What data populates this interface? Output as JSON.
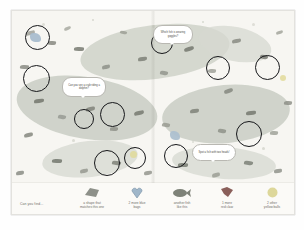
{
  "page": {
    "type": "seek-and-find picture book spread",
    "theme": "underwater ocean scene"
  },
  "scene": {
    "bubbles": [
      {
        "id": "crab-dolphin",
        "text": "Can you see a crab riding a dolphin?"
      },
      {
        "id": "goggles-fish",
        "text": "Which fish is wearing goggles?"
      },
      {
        "id": "two-heads-fish",
        "text": "Spot a fish with two heads!"
      }
    ],
    "circled_targets": 11
  },
  "legend": {
    "intro": "Can you find...",
    "items": [
      {
        "icon": "grey-shape-icon",
        "color": "#8d9089",
        "caption": "a shape that\nmatches this one"
      },
      {
        "icon": "blue-bag-icon",
        "color": "#9fb6c9",
        "caption": "2 more blue\nbags"
      },
      {
        "icon": "fish-icon",
        "color": "#7e8278",
        "caption": "another fish\nlike this"
      },
      {
        "icon": "red-claw-icon",
        "color": "#8a5f5a",
        "caption": "1 more\nred claw"
      },
      {
        "icon": "yellow-ball-icon",
        "color": "#ddd79a",
        "caption": "2 other\nyellow balls"
      }
    ]
  },
  "colors": {
    "paper": "#fdfdfc",
    "scene_bg": "#f7f6f2",
    "ink": "#16171a",
    "caption_text": "#6e6d68"
  }
}
